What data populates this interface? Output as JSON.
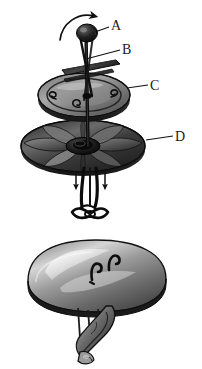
{
  "figure": {
    "background_color": "#ffffff",
    "ink_color": "#1a1a1a",
    "width": 202,
    "height": 369,
    "style": "grayscale halftone line illustration"
  },
  "labels": [
    {
      "id": "A",
      "text": "A",
      "target": "top-knob",
      "description": "Knob at the top of the vertical shaft, indicated by a curved rotation arrow",
      "x": 111,
      "y": 19,
      "leader_from": [
        109,
        27
      ],
      "leader_to": [
        93,
        32
      ]
    },
    {
      "id": "B",
      "text": "B",
      "target": "upper-flat-plate",
      "description": "Thin flat plate or vane mounted on the shaft below the knob",
      "x": 122,
      "y": 43,
      "leader_from": [
        120,
        51
      ],
      "leader_to": [
        85,
        56
      ]
    },
    {
      "id": "C",
      "text": "C",
      "target": "middle-disc",
      "description": "Middle elliptical disc / plate with spiral hook fittings",
      "x": 150,
      "y": 79,
      "leader_from": [
        148,
        86
      ],
      "leader_to": [
        128,
        88
      ]
    },
    {
      "id": "D",
      "text": "D",
      "target": "lower-impeller",
      "description": "Lower bladed impeller / fan disc",
      "x": 175,
      "y": 130,
      "leader_from": [
        173,
        137
      ],
      "leader_to": [
        148,
        140
      ]
    }
  ],
  "annotations": {
    "rotation_arrow": {
      "name": "clockwise-rotation-arrow",
      "description": "Curved arrow above the knob indicating clockwise rotation of part A",
      "direction": "clockwise"
    },
    "downward_arrows": [
      {
        "name": "downward-flow-arrow-left",
        "description": "Small straight arrow pointing down on the left of the central leg",
        "direction": "down",
        "x": 76,
        "y": 178
      },
      {
        "name": "downward-flow-arrow-right",
        "description": "Small straight arrow pointing down on the right of the central leg",
        "direction": "down",
        "x": 104,
        "y": 178
      }
    ]
  },
  "components": [
    {
      "name": "top-knob",
      "description": "Dark rounded knob / finial at the top of the shaft"
    },
    {
      "name": "central-shaft",
      "description": "Vertical dark shaft running through the upper assembly"
    },
    {
      "name": "upper-flat-plate",
      "description": "Thin angled flat plate crossing the shaft (part B)"
    },
    {
      "name": "middle-disc",
      "description": "Elliptical middle disc with rim and two small spiral hooks (part C)"
    },
    {
      "name": "lower-impeller",
      "description": "Large lower disc with radial curved blades forming a fan (part D)"
    },
    {
      "name": "central-leg-assembly",
      "description": "Legs and looped wire frame hanging below the impeller hub"
    },
    {
      "name": "lower-dome",
      "description": "Separate glossy elliptical dome / lid shown below the main assembly"
    },
    {
      "name": "dome-hooks",
      "description": "Two small wire hooks on the upper surface of the dome"
    },
    {
      "name": "hanging-bracket",
      "description": "Clamp or bracket linkage suspended beneath the dome"
    }
  ]
}
